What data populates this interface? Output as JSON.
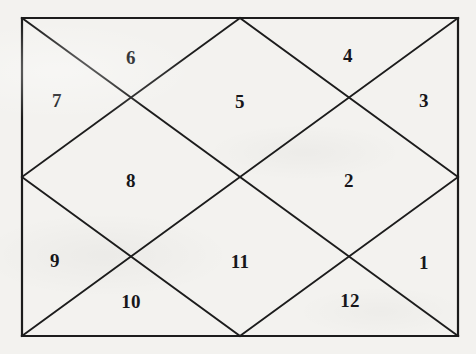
{
  "diagram": {
    "type": "north-indian-chart",
    "shape": "rectangle-with-diagonals-and-inner-diamond",
    "house_count": 12,
    "colors": {
      "background": "#f3f2ef",
      "line": "#1c1c1c",
      "text": "#16161a"
    },
    "frame": {
      "left": 22,
      "top": 18,
      "right": 458,
      "bottom": 336,
      "center_x": 240,
      "center_y": 177,
      "stroke_width": 2.2
    },
    "lines": [
      {
        "name": "border-top",
        "x1": 22,
        "y1": 18,
        "x2": 458,
        "y2": 18
      },
      {
        "name": "border-right",
        "x1": 458,
        "y1": 18,
        "x2": 458,
        "y2": 336
      },
      {
        "name": "border-bottom",
        "x1": 458,
        "y1": 336,
        "x2": 22,
        "y2": 336
      },
      {
        "name": "border-left",
        "x1": 22,
        "y1": 336,
        "x2": 22,
        "y2": 18
      },
      {
        "name": "diagonal-tl-br",
        "x1": 22,
        "y1": 18,
        "x2": 458,
        "y2": 336
      },
      {
        "name": "diagonal-tr-bl",
        "x1": 458,
        "y1": 18,
        "x2": 22,
        "y2": 336
      },
      {
        "name": "inner-diamond-top-right",
        "x1": 240,
        "y1": 18,
        "x2": 458,
        "y2": 177
      },
      {
        "name": "inner-diamond-right-bottom",
        "x1": 458,
        "y1": 177,
        "x2": 240,
        "y2": 336
      },
      {
        "name": "inner-diamond-bottom-left",
        "x1": 240,
        "y1": 336,
        "x2": 22,
        "y2": 177
      },
      {
        "name": "inner-diamond-left-top",
        "x1": 22,
        "y1": 177,
        "x2": 240,
        "y2": 18
      }
    ],
    "houses": [
      {
        "number": "1",
        "x": 424,
        "y": 262,
        "position": "right-lower-triangle"
      },
      {
        "number": "2",
        "x": 349,
        "y": 180,
        "position": "right-diamond"
      },
      {
        "number": "3",
        "x": 424,
        "y": 100,
        "position": "right-upper-triangle"
      },
      {
        "number": "4",
        "x": 348,
        "y": 55,
        "position": "top-right-triangle"
      },
      {
        "number": "5",
        "x": 240,
        "y": 101,
        "position": "top-diamond"
      },
      {
        "number": "6",
        "x": 131,
        "y": 57,
        "position": "top-left-triangle"
      },
      {
        "number": "7",
        "x": 57,
        "y": 100,
        "position": "left-upper-triangle"
      },
      {
        "number": "8",
        "x": 131,
        "y": 180,
        "position": "left-diamond"
      },
      {
        "number": "9",
        "x": 55,
        "y": 260,
        "position": "left-lower-triangle"
      },
      {
        "number": "10",
        "x": 131,
        "y": 301,
        "position": "bottom-left-triangle"
      },
      {
        "number": "11",
        "x": 240,
        "y": 261,
        "position": "bottom-diamond"
      },
      {
        "number": "12",
        "x": 350,
        "y": 300,
        "position": "bottom-right-triangle"
      }
    ]
  }
}
